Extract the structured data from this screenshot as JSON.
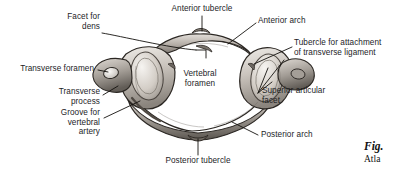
{
  "figure": {
    "background_color": "#ffffff",
    "text_color": "#1d1d1f",
    "leader_color": "#14120f",
    "caption_label": "Fig.",
    "caption_text": "Atla"
  },
  "labels": {
    "facet_for_dens": "Facet for\ndens",
    "anterior_tubercle": "Anterior tubercle",
    "anterior_arch": "Anterior arch",
    "tubercle_for_attachment": "Tubercle for attachment\nof transverse ligament",
    "transverse_foramen": "Transverse foramen",
    "transverse_process": "Transverse\nprocess",
    "vertebral_foramen": "Vertebral\nforamen",
    "superior_articular_facet": "Superior articular\nfacet",
    "groove_for_vertebral_artery": "Groove for\nvertebral\nartery",
    "posterior_arch": "Posterior arch",
    "posterior_tubercle": "Posterior tubercle"
  },
  "bone_palette": {
    "outline": "#2b2723",
    "light": "#efece8",
    "mid": "#c3bdb6",
    "shade": "#8d8780",
    "dark": "#5d5751",
    "deep": "#3a3531"
  }
}
